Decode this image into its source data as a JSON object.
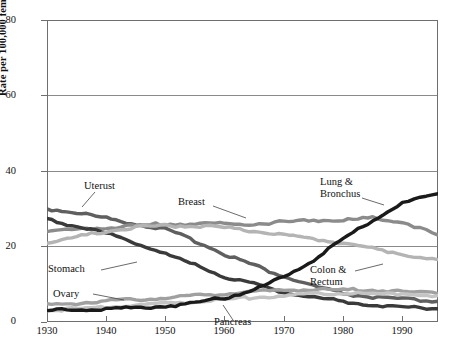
{
  "chart_data": {
    "type": "line",
    "title": "",
    "xlabel": "",
    "ylabel": "Rate per 100,000 female population",
    "xlim": [
      1930,
      1996
    ],
    "ylim": [
      0,
      80
    ],
    "grid": true,
    "legend_position": "inline-annotations",
    "xticks": [
      "1930",
      "1940",
      "1950",
      "1960",
      "1970",
      "1980",
      "1990"
    ],
    "xtick_values": [
      1930,
      1940,
      1950,
      1960,
      1970,
      1980,
      1990
    ],
    "yticks": [
      "0",
      "20",
      "40",
      "60",
      "80"
    ],
    "ytick_values": [
      0,
      20,
      40,
      60,
      80
    ],
    "x": [
      1930,
      1935,
      1940,
      1945,
      1950,
      1955,
      1960,
      1965,
      1970,
      1975,
      1980,
      1985,
      1990,
      1996
    ],
    "series": [
      {
        "name": "Uterust",
        "color": "#5f5f5f",
        "label": "Uterust",
        "values": [
          30.0,
          29.0,
          27.5,
          26.0,
          24.5,
          21.5,
          18.0,
          15.0,
          12.0,
          9.5,
          7.5,
          6.5,
          6.0,
          5.5
        ]
      },
      {
        "name": "Breast",
        "color": "#8b8b8b",
        "label": "Breast",
        "values": [
          24.0,
          24.5,
          25.0,
          25.5,
          26.0,
          26.0,
          26.0,
          26.0,
          26.5,
          27.0,
          27.0,
          27.5,
          26.5,
          23.0
        ]
      },
      {
        "name": "Stomach",
        "color": "#3a3a3a",
        "label": "Stomach",
        "values": [
          27.0,
          25.5,
          23.5,
          21.0,
          18.0,
          15.0,
          12.0,
          10.0,
          8.0,
          6.5,
          5.5,
          4.5,
          4.0,
          3.5
        ]
      },
      {
        "name": "Colon & Rectum",
        "color": "#b4b4b4",
        "label": "Colon &\nRectum",
        "values": [
          21.0,
          22.5,
          24.0,
          25.0,
          25.5,
          25.5,
          25.0,
          24.0,
          23.0,
          22.0,
          21.0,
          19.5,
          18.0,
          16.5
        ]
      },
      {
        "name": "Ovary",
        "color": "#a0a0a0",
        "label": "Ovary",
        "values": [
          4.5,
          5.0,
          5.5,
          6.0,
          6.5,
          7.0,
          7.5,
          8.0,
          8.5,
          8.5,
          8.5,
          8.5,
          8.0,
          7.5
        ]
      },
      {
        "name": "Pancreas",
        "color": "#c4c4c4",
        "label": "Pancreas",
        "values": [
          3.0,
          3.5,
          4.0,
          4.5,
          5.0,
          5.5,
          6.0,
          6.5,
          7.0,
          7.5,
          7.5,
          7.5,
          7.5,
          7.0
        ]
      },
      {
        "name": "Lung & Bronchus",
        "color": "#1a1a1a",
        "label": "Lung &\nBronchus",
        "values": [
          3.0,
          3.2,
          3.5,
          3.8,
          4.2,
          5.0,
          6.5,
          8.5,
          12.0,
          16.5,
          22.0,
          27.0,
          31.5,
          34.0
        ]
      }
    ],
    "annotations": [
      {
        "name": "uterus",
        "text": "Uterust"
      },
      {
        "name": "breast",
        "text": "Breast"
      },
      {
        "name": "stomach",
        "text": "Stomach"
      },
      {
        "name": "colon-rectum",
        "line1": "Colon &",
        "line2": "Rectum"
      },
      {
        "name": "ovary",
        "text": "Ovary"
      },
      {
        "name": "pancreas",
        "text": "Pancreas"
      },
      {
        "name": "lung-bronchus",
        "line1": "Lung &",
        "line2": "Bronchus"
      }
    ]
  }
}
